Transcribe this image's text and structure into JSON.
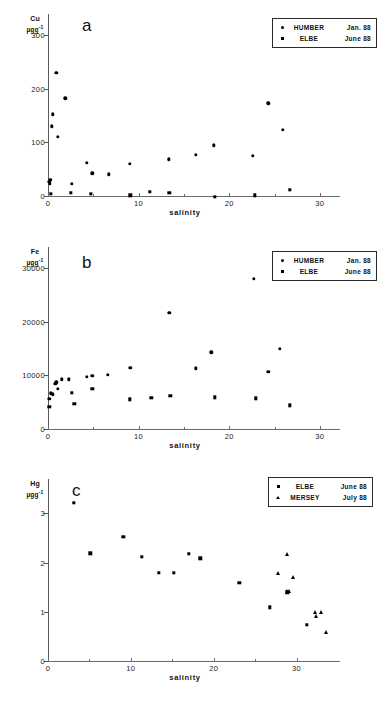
{
  "figure": {
    "xlabel": "salinity",
    "background": "#ffffff",
    "marker_color": "#000000"
  },
  "panels": [
    {
      "letter": "a",
      "ylabel_element": "Cu",
      "ylabel_unit": "µgg",
      "ylabel_exponent": "-1",
      "xlabel": "salinity",
      "yticks": [
        "0",
        "100",
        "200",
        "300"
      ],
      "xticks": [
        "0",
        "10",
        "20",
        "30"
      ],
      "legend": [
        {
          "marker": "circle",
          "name": "HUMBER",
          "date": "Jan. 88"
        },
        {
          "marker": "square",
          "name": "ELBE",
          "date": "June 88"
        }
      ]
    },
    {
      "letter": "b",
      "ylabel_element": "Fe",
      "ylabel_unit": "µgg",
      "ylabel_exponent": "-1",
      "xlabel": "salinity",
      "yticks": [
        "0",
        "10000",
        "20000",
        "30000"
      ],
      "xticks": [
        "0",
        "10",
        "20",
        "30"
      ],
      "legend": [
        {
          "marker": "circle",
          "name": "HUMBER",
          "date": "Jan. 88"
        },
        {
          "marker": "square",
          "name": "ELBE",
          "date": "June 88"
        }
      ]
    },
    {
      "letter": "c",
      "ylabel_element": "Hg",
      "ylabel_unit": "µgg",
      "ylabel_exponent": "-1",
      "xlabel": "salinity",
      "yticks": [
        "0",
        "1",
        "2",
        "3"
      ],
      "xticks": [
        "0",
        "10",
        "20",
        "30"
      ],
      "legend": [
        {
          "marker": "square",
          "name": "ELBE",
          "date": "June 88"
        },
        {
          "marker": "triangle",
          "name": "MERSEY",
          "date": "July 88"
        }
      ]
    }
  ],
  "chart_data": [
    {
      "type": "scatter",
      "panel": "a",
      "title": "",
      "xlabel": "salinity",
      "ylabel": "Cu µgg-1",
      "xlim": [
        0,
        32
      ],
      "ylim": [
        0,
        340
      ],
      "xticks": [
        0,
        10,
        20,
        30
      ],
      "yticks": [
        0,
        100,
        200,
        300
      ],
      "grid": false,
      "legend_position": "top-right",
      "series": [
        {
          "name": "HUMBER",
          "date": "Jan. 88",
          "marker": "circle",
          "points": [
            [
              0.15,
              34
            ],
            [
              0.2,
              30
            ],
            [
              0.25,
              38
            ],
            [
              0.5,
              160
            ],
            [
              0.45,
              138
            ],
            [
              0.9,
              238
            ],
            [
              1.1,
              118
            ],
            [
              1.9,
              190
            ],
            [
              2.6,
              30
            ],
            [
              4.3,
              70
            ],
            [
              4.9,
              50
            ],
            [
              6.7,
              48
            ],
            [
              9.0,
              68
            ],
            [
              13.3,
              76
            ],
            [
              16.3,
              85
            ],
            [
              18.3,
              102
            ],
            [
              22.6,
              83
            ],
            [
              24.3,
              181
            ],
            [
              25.9,
              131
            ]
          ]
        },
        {
          "name": "ELBE",
          "date": "June 88",
          "marker": "square",
          "points": [
            [
              0.3,
              12
            ],
            [
              2.5,
              14
            ],
            [
              4.7,
              12
            ],
            [
              9.1,
              9
            ],
            [
              11.2,
              15
            ],
            [
              13.4,
              14
            ],
            [
              18.4,
              6
            ],
            [
              22.8,
              9
            ],
            [
              26.7,
              19
            ]
          ]
        }
      ]
    },
    {
      "type": "scatter",
      "panel": "b",
      "title": "",
      "xlabel": "salinity",
      "ylabel": "Fe µgg-1",
      "xlim": [
        0,
        32
      ],
      "ylim": [
        0,
        34000
      ],
      "xticks": [
        0,
        10,
        20,
        30
      ],
      "yticks": [
        0,
        10000,
        20000,
        30000
      ],
      "grid": false,
      "legend_position": "top-right",
      "series": [
        {
          "name": "HUMBER",
          "date": "Jan. 88",
          "marker": "circle",
          "points": [
            [
              0.15,
              6400
            ],
            [
              0.3,
              7400
            ],
            [
              0.5,
              7200
            ],
            [
              0.8,
              9200
            ],
            [
              0.9,
              9500
            ],
            [
              1.1,
              8300
            ],
            [
              1.5,
              10000
            ],
            [
              2.3,
              10000
            ],
            [
              4.3,
              10500
            ],
            [
              4.9,
              10700
            ],
            [
              6.6,
              10900
            ],
            [
              9.1,
              12200
            ],
            [
              13.4,
              22400
            ],
            [
              16.3,
              12100
            ],
            [
              18.0,
              15100
            ],
            [
              22.7,
              28800
            ],
            [
              24.3,
              11400
            ],
            [
              25.6,
              15700
            ]
          ]
        },
        {
          "name": "ELBE",
          "date": "June 88",
          "marker": "square",
          "points": [
            [
              0.15,
              4900
            ],
            [
              2.6,
              7500
            ],
            [
              2.9,
              5400
            ],
            [
              4.9,
              8200
            ],
            [
              9.0,
              6300
            ],
            [
              11.4,
              6600
            ],
            [
              13.5,
              7000
            ],
            [
              18.4,
              6700
            ],
            [
              22.9,
              6500
            ],
            [
              26.7,
              5200
            ]
          ]
        }
      ]
    },
    {
      "type": "scatter",
      "panel": "c",
      "title": "",
      "xlabel": "salinity",
      "ylabel": "Hg µgg-1",
      "xlim": [
        0,
        35
      ],
      "ylim": [
        0,
        3.7
      ],
      "xticks": [
        0,
        10,
        20,
        30
      ],
      "yticks": [
        0,
        1,
        2,
        3
      ],
      "grid": false,
      "legend_position": "top-right",
      "series": [
        {
          "name": "ELBE",
          "date": "June 88",
          "marker": "square",
          "points": [
            [
              3.1,
              3.3
            ],
            [
              5.1,
              2.27
            ],
            [
              9.1,
              2.6
            ],
            [
              11.3,
              2.2
            ],
            [
              13.4,
              1.88
            ],
            [
              15.2,
              1.88
            ],
            [
              17.0,
              2.26
            ],
            [
              18.4,
              2.17
            ],
            [
              23.1,
              1.67
            ],
            [
              26.8,
              1.17
            ],
            [
              28.9,
              1.48
            ],
            [
              31.2,
              0.82
            ]
          ]
        },
        {
          "name": "MERSEY",
          "date": "July 88",
          "marker": "triangle",
          "points": [
            [
              28.9,
              2.25
            ],
            [
              27.7,
              1.87
            ],
            [
              29.6,
              1.79
            ],
            [
              28.9,
              1.5
            ],
            [
              29.1,
              1.5
            ],
            [
              32.2,
              1.08
            ],
            [
              32.4,
              0.99
            ],
            [
              33.0,
              1.07
            ],
            [
              33.6,
              0.68
            ]
          ]
        }
      ]
    }
  ]
}
